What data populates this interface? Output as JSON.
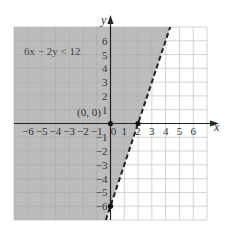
{
  "chart_data": {
    "type": "line",
    "title": "",
    "xlabel": "x",
    "ylabel": "y",
    "xlim": [
      -7,
      7
    ],
    "ylim": [
      -7,
      7
    ],
    "grid": true,
    "x_ticks": [
      -6,
      -5,
      -4,
      -3,
      -2,
      -1,
      0,
      1,
      2,
      3,
      4,
      5,
      6
    ],
    "y_ticks": [
      -6,
      -5,
      -4,
      -3,
      -2,
      -1,
      1,
      2,
      3,
      4,
      5,
      6
    ],
    "x_tick_labels": [
      "−6",
      "−5",
      "−4",
      "−3",
      "−2",
      "−1",
      "0",
      "1",
      "2",
      "3",
      "4",
      "5",
      "6"
    ],
    "y_tick_labels": [
      "−6",
      "−5",
      "−4",
      "−3",
      "−2",
      "−1",
      "1",
      "2",
      "3",
      "4",
      "5",
      "6"
    ],
    "boundary_line": {
      "equation": "6x − 2y = 12",
      "slope": 3,
      "intercept": -6,
      "style": "dashed",
      "x": [
        -0.333,
        4.333
      ],
      "y": [
        -7,
        7
      ]
    },
    "inequality": "6x − 2y < 12",
    "shaded_region": "left/above boundary line",
    "points": [
      {
        "label": "(0, 0)",
        "x": 0,
        "y": 0,
        "note": "test point"
      },
      {
        "label": "",
        "x": 2,
        "y": 0,
        "note": "x-intercept"
      },
      {
        "label": "",
        "x": 0,
        "y": -6,
        "note": "y-intercept"
      }
    ],
    "annotations": [
      "6x − 2y < 12",
      "(0, 0)"
    ]
  },
  "labels": {
    "inequality": "6x − 2y < 12",
    "test_point": "(0, 0)",
    "x_axis": "x",
    "y_axis": "y",
    "origin": "0"
  },
  "colors": {
    "shade": "#bcbcbc",
    "grid_on_shade": "#a9a9a9",
    "grid": "#c8c8c8",
    "axis": "#222222",
    "line": "#222222",
    "background": "#ffffff"
  }
}
